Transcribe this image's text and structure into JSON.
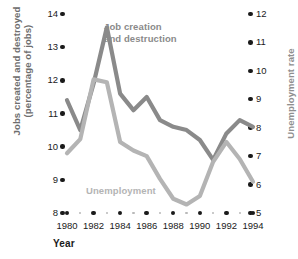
{
  "chart_data": {
    "type": "line",
    "title": "",
    "xlabel": "Year",
    "ylabel": "Jobs created and destroyed\n(percentage of jobs)",
    "ylabel_right": "Unemployment rate",
    "x": [
      1980,
      1981,
      1982,
      1983,
      1984,
      1985,
      1986,
      1987,
      1988,
      1989,
      1990,
      1991,
      1992,
      1993,
      1994
    ],
    "xlim": [
      1980,
      1994
    ],
    "xticks": [
      "1980",
      "1982",
      "1984",
      "1986",
      "1988",
      "1990",
      "1992",
      "1994"
    ],
    "yticks_left": [
      "14",
      "13",
      "12",
      "11",
      "10",
      "9",
      "8"
    ],
    "ylim_left": [
      8,
      14
    ],
    "yticks_right": [
      "12",
      "11",
      "10",
      "9",
      "8",
      "7",
      "6",
      "5"
    ],
    "ylim_right": [
      5,
      12
    ],
    "grid": false,
    "legend": "annotations",
    "series": [
      {
        "name": "Job creation and destruction",
        "axis": "left",
        "color": "#8a8a8a",
        "label": "Job creation\nand destruction",
        "values": [
          11.4,
          10.5,
          11.9,
          13.6,
          11.6,
          11.1,
          11.5,
          10.8,
          10.6,
          10.5,
          10.2,
          9.6,
          10.4,
          10.8,
          10.6
        ]
      },
      {
        "name": "Unemployment",
        "axis": "right",
        "color": "#b4b4b4",
        "label": "Unemployment",
        "values": [
          7.1,
          7.6,
          9.7,
          9.6,
          7.5,
          7.2,
          7.0,
          6.2,
          5.5,
          5.3,
          5.6,
          6.8,
          7.5,
          6.9,
          6.1
        ]
      }
    ]
  },
  "axes": {
    "left_title": "Jobs created and destroyed (percentage of jobs)",
    "left_title_line1": "Jobs created and destroyed",
    "left_title_line2": "(percentage of jobs)",
    "right_title": "Unemployment rate",
    "x_title": "Year"
  }
}
